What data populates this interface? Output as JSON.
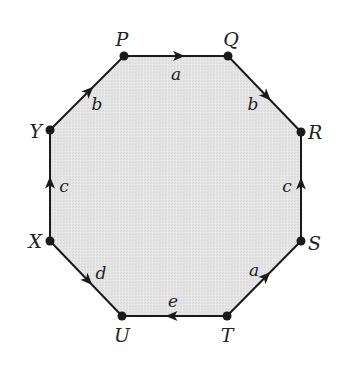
{
  "diagram": {
    "type": "octagon-edge-identification",
    "fill_color": "#e6e6e6",
    "stroke_color": "#1a1a1a",
    "vertices": [
      {
        "id": "P",
        "label": "P",
        "x": 124,
        "y": 56,
        "lx": 122,
        "ly": 46,
        "anchor": "middle"
      },
      {
        "id": "Q",
        "label": "Q",
        "x": 228,
        "y": 56,
        "lx": 231,
        "ly": 46,
        "anchor": "middle"
      },
      {
        "id": "R",
        "label": "R",
        "x": 301,
        "y": 132,
        "lx": 308,
        "ly": 139,
        "anchor": "start"
      },
      {
        "id": "S",
        "label": "S",
        "x": 301,
        "y": 241,
        "lx": 308,
        "ly": 250,
        "anchor": "start"
      },
      {
        "id": "T",
        "label": "T",
        "x": 227,
        "y": 316,
        "lx": 227,
        "ly": 342,
        "anchor": "middle"
      },
      {
        "id": "U",
        "label": "U",
        "x": 122,
        "y": 316,
        "lx": 122,
        "ly": 342,
        "anchor": "middle"
      },
      {
        "id": "X",
        "label": "X",
        "x": 50,
        "y": 241,
        "lx": 42,
        "ly": 248,
        "anchor": "end"
      },
      {
        "id": "Y",
        "label": "Y",
        "x": 50,
        "y": 130,
        "lx": 42,
        "ly": 138,
        "anchor": "end"
      }
    ],
    "edges": [
      {
        "from": "P",
        "to": "Q",
        "label": "a",
        "lx": 176,
        "ly": 80
      },
      {
        "from": "Q",
        "to": "R",
        "label": "b",
        "lx": 253,
        "ly": 110
      },
      {
        "from": "S",
        "to": "R",
        "label": "c",
        "lx": 287,
        "ly": 192
      },
      {
        "from": "T",
        "to": "S",
        "label": "a",
        "lx": 254,
        "ly": 276
      },
      {
        "from": "T",
        "to": "U",
        "label": "e",
        "lx": 173,
        "ly": 307
      },
      {
        "from": "X",
        "to": "U",
        "label": "d",
        "lx": 101,
        "ly": 279
      },
      {
        "from": "X",
        "to": "Y",
        "label": "c",
        "lx": 64,
        "ly": 192
      },
      {
        "from": "Y",
        "to": "P",
        "label": "b",
        "lx": 97,
        "ly": 110
      }
    ]
  }
}
